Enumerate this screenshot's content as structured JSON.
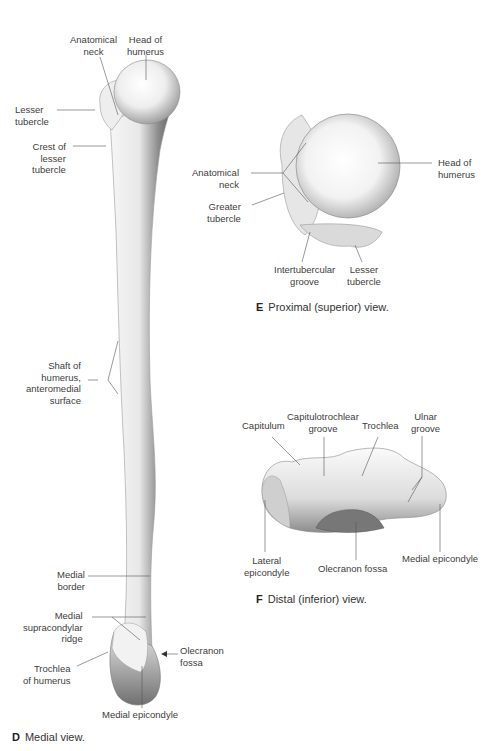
{
  "figure_D": {
    "caption_letter": "D",
    "caption_text": "Medial view.",
    "labels": {
      "anatomical_neck": "Anatomical\nneck",
      "head_of_humerus": "Head of\nhumerus",
      "lesser_tubercle": "Lesser\ntubercle",
      "crest_of_lesser_tubercle": "Crest of\nlesser\ntubercle",
      "shaft": "Shaft of\nhumerus,\nanteromedial\nsurface",
      "medial_border": "Medial\nborder",
      "medial_supracondylar_ridge": "Medial\nsupracondylar\nridge",
      "olecranon_fossa": "Olecranon\nfossa",
      "trochlea_of_humerus": "Trochlea\nof humerus",
      "medial_epicondyle": "Medial epicondyle"
    }
  },
  "figure_E": {
    "caption_letter": "E",
    "caption_text": "Proximal (superior) view.",
    "labels": {
      "anatomical_neck": "Anatomical\nneck",
      "greater_tubercle": "Greater\ntubercle",
      "head_of_humerus": "Head of\nhumerus",
      "intertubercular_groove": "Intertubercular\ngroove",
      "lesser_tubercle": "Lesser\ntubercle"
    }
  },
  "figure_F": {
    "caption_letter": "F",
    "caption_text": "Distal (inferior) view.",
    "labels": {
      "capitulum": "Capitulum",
      "capitulotrochlear_groove": "Capitulotrochlear\ngroove",
      "trochlea": "Trochlea",
      "ulnar_groove": "Ulnar\ngroove",
      "lateral_epicondyle": "Lateral\nepicondyle",
      "olecranon_fossa": "Olecranon fossa",
      "medial_epicondyle": "Medial epicondyle"
    }
  }
}
